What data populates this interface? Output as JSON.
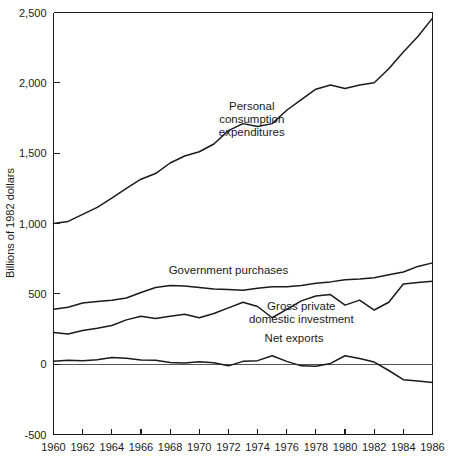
{
  "chart_data": {
    "type": "line",
    "title": "",
    "subtitle": "",
    "xlabel": "",
    "ylabel": "Billions of 1982 dollars",
    "xlim": [
      1960,
      1986
    ],
    "ylim": [
      -500,
      2500
    ],
    "grid": false,
    "legend_position": "inline-annotations",
    "x": [
      1960,
      1961,
      1962,
      1963,
      1964,
      1965,
      1966,
      1967,
      1968,
      1969,
      1970,
      1971,
      1972,
      1973,
      1974,
      1975,
      1976,
      1977,
      1978,
      1979,
      1980,
      1981,
      1982,
      1983,
      1984,
      1985,
      1986
    ],
    "y_ticks": [
      -500,
      0,
      500,
      1000,
      1500,
      2000,
      2500
    ],
    "y_tick_labels": [
      "-500",
      "0",
      "500",
      "1,000",
      "1,500",
      "2,000",
      "2,500"
    ],
    "x_ticks": [
      1960,
      1962,
      1964,
      1966,
      1968,
      1970,
      1972,
      1974,
      1976,
      1978,
      1980,
      1982,
      1984,
      1986
    ],
    "x_tick_labels": [
      "1960",
      "1962",
      "1964",
      "1966",
      "1968",
      "1970",
      "1972",
      "1974",
      "1976",
      "1978",
      "1980",
      "1982",
      "1984",
      "1986"
    ],
    "x_minor_ticks": [
      1961,
      1963,
      1965,
      1967,
      1969,
      1971,
      1973,
      1975,
      1977,
      1979,
      1981,
      1983,
      1985
    ],
    "series": [
      {
        "name": "Personal consumption expenditures",
        "label": "Personal consumption expenditures",
        "label_lines": [
          "Personal",
          "consumption",
          "expenditures"
        ],
        "label_x": 1973.6,
        "label_y": 1810,
        "values": [
          1000,
          1015,
          1065,
          1115,
          1180,
          1250,
          1315,
          1355,
          1430,
          1480,
          1510,
          1565,
          1660,
          1710,
          1690,
          1710,
          1805,
          1880,
          1955,
          1985,
          1960,
          1985,
          2000,
          2100,
          2220,
          2330,
          2460
        ]
      },
      {
        "name": "Government purchases",
        "label": "Government purchases",
        "label_lines": [
          "Government purchases"
        ],
        "label_x": 1972.0,
        "label_y": 640,
        "values": [
          390,
          405,
          435,
          445,
          455,
          470,
          510,
          545,
          560,
          555,
          545,
          535,
          530,
          525,
          540,
          550,
          550,
          560,
          575,
          585,
          600,
          605,
          615,
          635,
          655,
          695,
          720
        ]
      },
      {
        "name": "Gross private domestic investment",
        "label": "Gross private domestic investment",
        "label_lines": [
          "Gross private",
          "domestic investment"
        ],
        "label_x": 1977.0,
        "label_y": 385,
        "values": [
          225,
          215,
          240,
          255,
          275,
          315,
          340,
          325,
          340,
          355,
          330,
          360,
          400,
          440,
          410,
          330,
          390,
          450,
          485,
          495,
          420,
          455,
          385,
          440,
          570,
          580,
          590
        ]
      },
      {
        "name": "Net exports",
        "label": "Net exports",
        "label_lines": [
          "Net exports"
        ],
        "label_x": 1976.5,
        "label_y": 160,
        "values": [
          20,
          28,
          25,
          32,
          48,
          42,
          30,
          28,
          12,
          8,
          18,
          10,
          -12,
          20,
          25,
          60,
          20,
          -12,
          -15,
          5,
          60,
          40,
          15,
          -45,
          -110,
          -120,
          -130
        ]
      }
    ]
  },
  "axis": {
    "y_title": "Billions of 1982 dollars"
  }
}
